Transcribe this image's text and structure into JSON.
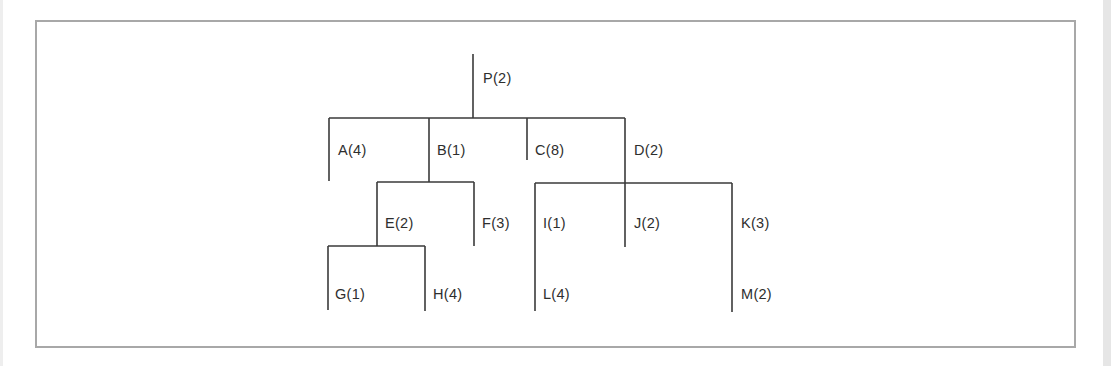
{
  "diagram": {
    "type": "tree",
    "root": "P",
    "nodes": [
      {
        "id": "P",
        "label": "P(2)",
        "value": 2,
        "parent": null
      },
      {
        "id": "A",
        "label": "A(4)",
        "value": 4,
        "parent": "P"
      },
      {
        "id": "B",
        "label": "B(1)",
        "value": 1,
        "parent": "P"
      },
      {
        "id": "C",
        "label": "C(8)",
        "value": 8,
        "parent": "P"
      },
      {
        "id": "D",
        "label": "D(2)",
        "value": 2,
        "parent": "P"
      },
      {
        "id": "E",
        "label": "E(2)",
        "value": 2,
        "parent": "B"
      },
      {
        "id": "F",
        "label": "F(3)",
        "value": 3,
        "parent": "B"
      },
      {
        "id": "I",
        "label": "I(1)",
        "value": 1,
        "parent": "D"
      },
      {
        "id": "J",
        "label": "J(2)",
        "value": 2,
        "parent": "D"
      },
      {
        "id": "K",
        "label": "K(3)",
        "value": 3,
        "parent": "D"
      },
      {
        "id": "G",
        "label": "G(1)",
        "value": 1,
        "parent": "E"
      },
      {
        "id": "H",
        "label": "H(4)",
        "value": 4,
        "parent": "E"
      },
      {
        "id": "L",
        "label": "L(4)",
        "value": 4,
        "parent": "I"
      },
      {
        "id": "M",
        "label": "M(2)",
        "value": 2,
        "parent": "K"
      }
    ],
    "labels": {
      "P": "P(2)",
      "A": "A(4)",
      "B": "B(1)",
      "C": "C(8)",
      "D": "D(2)",
      "E": "E(2)",
      "F": "F(3)",
      "G": "G(1)",
      "H": "H(4)",
      "I": "I(1)",
      "J": "J(2)",
      "K": "K(3)",
      "L": "L(4)",
      "M": "M(2)"
    }
  }
}
